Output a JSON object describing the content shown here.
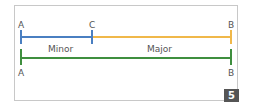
{
  "diagram": {
    "top_line": {
      "labels": {
        "start": "A",
        "middle": "C",
        "end": "B"
      },
      "segments": [
        {
          "name": "Minor",
          "from": "A",
          "to": "C",
          "color": "#4a7fc1"
        },
        {
          "name": "Major",
          "from": "C",
          "to": "B",
          "color": "#f0b84a"
        }
      ]
    },
    "bottom_line": {
      "labels": {
        "start": "A",
        "end": "B"
      },
      "color": "#3f8f3f"
    },
    "segment_labels": {
      "minor": "Minor",
      "major": "Major"
    },
    "badge": "5"
  }
}
